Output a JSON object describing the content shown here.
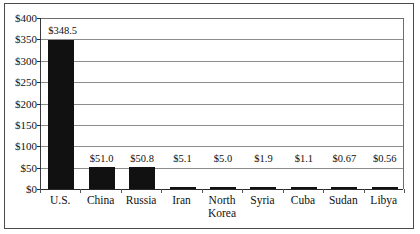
{
  "chart_data": {
    "type": "bar",
    "title": "",
    "subtitle": "",
    "xlabel": "",
    "ylabel": "",
    "categories": [
      "U.S.",
      "China",
      "Russia",
      "Iran",
      "North\nKorea",
      "Syria",
      "Cuba",
      "Sudan",
      "Libya"
    ],
    "values": [
      348.5,
      51.0,
      50.8,
      5.1,
      5.0,
      1.9,
      1.1,
      0.67,
      0.56
    ],
    "value_labels": [
      "$348.5",
      "$51.0",
      "$50.8",
      "$5.1",
      "$5.0",
      "$1.9",
      "$1.1",
      "$0.67",
      "$0.56"
    ],
    "ylim": [
      0,
      400
    ],
    "ytick_values": [
      0,
      50,
      100,
      150,
      200,
      250,
      300,
      350,
      400
    ],
    "ytick_labels": [
      "$0",
      "$50",
      "$100",
      "$150",
      "$200",
      "$250",
      "$300",
      "$350",
      "$400"
    ],
    "grid": true,
    "grid_axis": "y",
    "legend": false,
    "bar_color": "#111111",
    "axis_color": "#2a2a2a",
    "grid_color": "#8c8c8c",
    "background_color": "#ffffff",
    "frame_border_color": "#4a4a4a"
  }
}
